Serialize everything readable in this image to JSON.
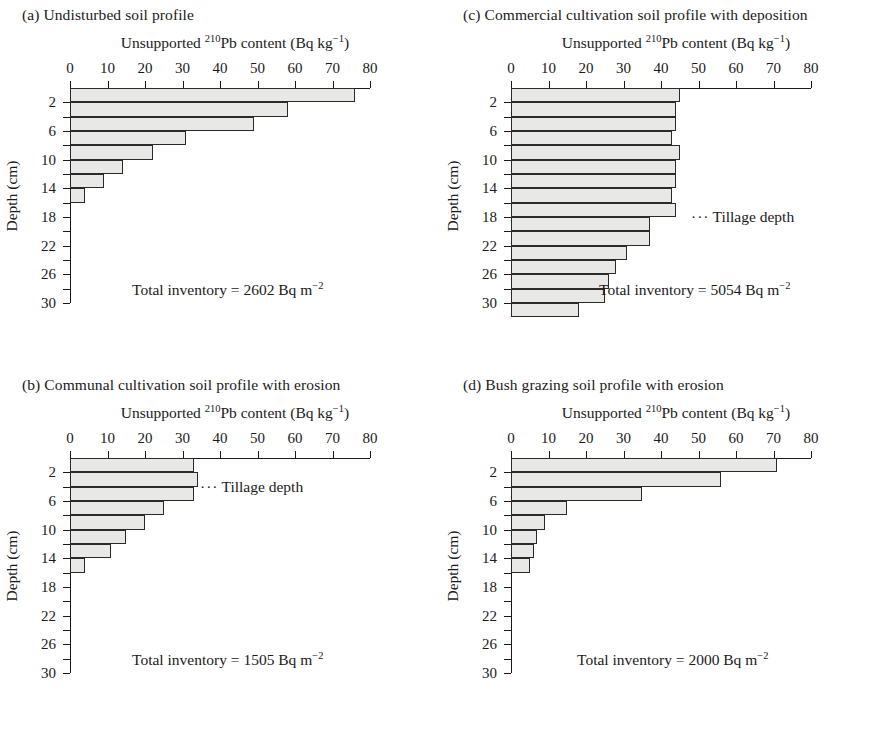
{
  "figure": {
    "axis_title_prefix": "Unsupported ",
    "axis_title_isotope": "210",
    "axis_title_mid": "Pb content (Bq kg",
    "axis_title_exp": "−1",
    "axis_title_suffix": ")",
    "y_axis_label": "Depth (cm)",
    "tillage_label": "Tillage depth",
    "tillage_dots": "···",
    "inventory_prefix": "Total inventory = ",
    "inventory_unit": " Bq m",
    "inventory_unit_exp": "−2",
    "x_ticks": [
      "0",
      "10",
      "20",
      "30",
      "40",
      "50",
      "60",
      "70",
      "80"
    ],
    "y_ticks": [
      "2",
      "6",
      "10",
      "14",
      "18",
      "22",
      "26",
      "30"
    ],
    "bar_fill": "#e8e8e6",
    "bar_stroke": "#2a2a2a"
  },
  "panels": [
    {
      "key": "a",
      "caption": "(a) Undisturbed soil profile",
      "inventory_value": "2602",
      "tillage": null
    },
    {
      "key": "b",
      "caption": "(b) Communal cultivation soil profile with erosion",
      "inventory_value": "1505",
      "tillage": 4
    },
    {
      "key": "c",
      "caption": "(c) Commercial cultivation soil profile with deposition",
      "inventory_value": "5054",
      "tillage": 18
    },
    {
      "key": "d",
      "caption": "(d) Bush grazing soil profile with erosion",
      "inventory_value": "2000",
      "tillage": null
    }
  ],
  "chart_data": [
    {
      "type": "bar",
      "panel": "a",
      "title": "(a) Undisturbed soil profile",
      "orientation": "horizontal",
      "xlabel": "Unsupported 210Pb content (Bq kg−1)",
      "ylabel": "Depth (cm)",
      "xlim": [
        0,
        80
      ],
      "ylim": [
        0,
        30
      ],
      "grid": false,
      "legend": null,
      "depth_intervals_cm": [
        [
          0,
          2
        ],
        [
          2,
          4
        ],
        [
          4,
          6
        ],
        [
          6,
          8
        ],
        [
          8,
          10
        ],
        [
          10,
          12
        ],
        [
          12,
          14
        ],
        [
          14,
          16
        ]
      ],
      "categories": [
        "0-2",
        "2-4",
        "4-6",
        "6-8",
        "8-10",
        "10-12",
        "12-14",
        "14-16"
      ],
      "values": [
        76,
        58,
        49,
        31,
        22,
        14,
        9,
        4
      ],
      "annotations": [
        "Total inventory = 2602 Bq m−2"
      ]
    },
    {
      "type": "bar",
      "panel": "b",
      "title": "(b) Communal cultivation soil profile with erosion",
      "orientation": "horizontal",
      "xlabel": "Unsupported 210Pb content (Bq kg−1)",
      "ylabel": "Depth (cm)",
      "xlim": [
        0,
        80
      ],
      "ylim": [
        0,
        30
      ],
      "grid": false,
      "legend": null,
      "depth_intervals_cm": [
        [
          0,
          2
        ],
        [
          2,
          4
        ],
        [
          4,
          6
        ],
        [
          6,
          8
        ],
        [
          8,
          10
        ],
        [
          10,
          12
        ],
        [
          12,
          14
        ],
        [
          14,
          16
        ]
      ],
      "categories": [
        "0-2",
        "2-4",
        "4-6",
        "6-8",
        "8-10",
        "10-12",
        "12-14",
        "14-16"
      ],
      "values": [
        33,
        34,
        33,
        25,
        20,
        15,
        11,
        4
      ],
      "annotations": [
        "Total inventory = 1505 Bq m−2",
        "Tillage depth at 4 cm"
      ]
    },
    {
      "type": "bar",
      "panel": "c",
      "title": "(c) Commercial cultivation soil profile with deposition",
      "orientation": "horizontal",
      "xlabel": "Unsupported 210Pb content (Bq kg−1)",
      "ylabel": "Depth (cm)",
      "xlim": [
        0,
        80
      ],
      "ylim": [
        0,
        30
      ],
      "grid": false,
      "legend": null,
      "depth_intervals_cm": [
        [
          0,
          2
        ],
        [
          2,
          4
        ],
        [
          4,
          6
        ],
        [
          6,
          8
        ],
        [
          8,
          10
        ],
        [
          10,
          12
        ],
        [
          12,
          14
        ],
        [
          14,
          16
        ],
        [
          16,
          18
        ],
        [
          18,
          20
        ],
        [
          20,
          22
        ],
        [
          22,
          24
        ],
        [
          24,
          26
        ],
        [
          26,
          28
        ],
        [
          28,
          30
        ],
        [
          30,
          32
        ]
      ],
      "categories": [
        "0-2",
        "2-4",
        "4-6",
        "6-8",
        "8-10",
        "10-12",
        "12-14",
        "14-16",
        "16-18",
        "18-20",
        "20-22",
        "22-24",
        "24-26",
        "26-28",
        "28-30",
        "30-32"
      ],
      "values": [
        45,
        44,
        44,
        43,
        45,
        44,
        44,
        43,
        44,
        37,
        37,
        31,
        28,
        26,
        25,
        18
      ],
      "annotations": [
        "Total inventory = 5054 Bq m−2",
        "Tillage depth at 18 cm"
      ]
    },
    {
      "type": "bar",
      "panel": "d",
      "title": "(d) Bush grazing soil profile with erosion",
      "orientation": "horizontal",
      "xlabel": "Unsupported 210Pb content (Bq kg−1)",
      "ylabel": "Depth (cm)",
      "xlim": [
        0,
        80
      ],
      "ylim": [
        0,
        30
      ],
      "grid": false,
      "legend": null,
      "depth_intervals_cm": [
        [
          0,
          2
        ],
        [
          2,
          4
        ],
        [
          4,
          6
        ],
        [
          6,
          8
        ],
        [
          8,
          10
        ],
        [
          10,
          12
        ],
        [
          12,
          14
        ],
        [
          14,
          16
        ]
      ],
      "categories": [
        "0-2",
        "2-4",
        "4-6",
        "6-8",
        "8-10",
        "10-12",
        "12-14",
        "14-16"
      ],
      "values": [
        71,
        56,
        35,
        15,
        9,
        7,
        6,
        5
      ],
      "annotations": [
        "Total inventory = 2000 Bq m−2"
      ]
    }
  ]
}
